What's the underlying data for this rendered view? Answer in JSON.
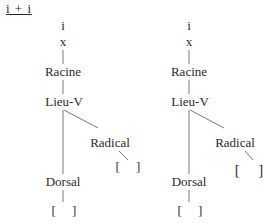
{
  "title": "i + i",
  "trees": [
    {
      "name": "left",
      "nodes": {
        "segment": "i",
        "timing": "x",
        "root": "Racine",
        "place": "Lieu-V",
        "radical": "Radical",
        "radical_value": "[     ]",
        "dorsal": "Dorsal",
        "dorsal_value": "[     ]"
      }
    },
    {
      "name": "right",
      "nodes": {
        "segment": "i",
        "timing": "x",
        "root": "Racine",
        "place": "Lieu-V",
        "radical": "Radical",
        "radical_value": "[     ]",
        "dorsal": "Dorsal",
        "dorsal_value": "[     ]"
      }
    }
  ]
}
